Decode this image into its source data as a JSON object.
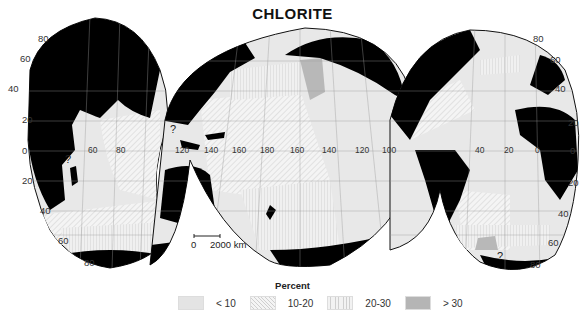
{
  "title": "CHLORITE",
  "map": {
    "projection": "interrupted (Goode-style) ocean-centered projection",
    "longitude_labels": {
      "indian_ocean": [
        "60",
        "80"
      ],
      "pacific_ocean": [
        "120",
        "140",
        "160",
        "180",
        "160",
        "140",
        "120",
        "100"
      ],
      "atlantic_ocean": [
        "40",
        "20",
        "0"
      ]
    },
    "latitude_labels_left": [
      "80",
      "60",
      "40",
      "20",
      "0",
      "20",
      "40",
      "60",
      "80"
    ],
    "latitude_labels_right": [
      "80",
      "60",
      "40",
      "20",
      "0",
      "20",
      "40",
      "60",
      "80"
    ],
    "uncertain_markers": [
      "?",
      "?",
      "?"
    ],
    "scale_bar": {
      "start": "0",
      "end": "2000 km"
    },
    "colors": {
      "land": "#000000",
      "lt10": "#e6e6e6",
      "10_20": "#f2f2f2",
      "20_30": "#eeeeee",
      "gt30": "#b8b8b8",
      "grid": "#9a9a9a"
    }
  },
  "legend": {
    "title": "Percent",
    "items": [
      {
        "label": "< 10",
        "pattern": "light-gray"
      },
      {
        "label": "10-20",
        "pattern": "diagonal-hatch"
      },
      {
        "label": "20-30",
        "pattern": "vertical-lines"
      },
      {
        "label": "> 30",
        "pattern": "dark-gray"
      }
    ]
  }
}
